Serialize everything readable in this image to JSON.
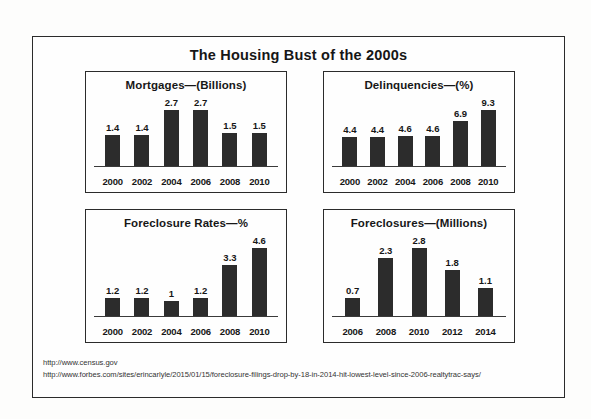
{
  "title": "The Housing Bust of the 2000s",
  "sources": {
    "line1": "http://www.census.gov",
    "line2": "http://www.forbes.com/sites/erincarlyle/2015/01/15/foreclosure-filings-drop-by-18-in-2014-hit-lowest-level-since-2006-realtytrac-says/"
  },
  "colors": {
    "bar": "#2c2c2c",
    "frame": "#2b2b2b",
    "text": "#161616",
    "background": "#fefefe"
  },
  "chart_data": [
    {
      "type": "bar",
      "title": "Mortgages—(Billions)",
      "xlabel": "",
      "ylabel": "Billions",
      "categories": [
        "2000",
        "2002",
        "2004",
        "2006",
        "2008",
        "2010"
      ],
      "values": [
        1.4,
        1.4,
        2.7,
        2.7,
        1.5,
        1.5
      ],
      "labels": [
        "1.4",
        "1.4",
        "2.7",
        "2.7",
        "1.5",
        "1.5"
      ],
      "ylim": [
        0,
        3.1
      ],
      "grid": false,
      "legend": "none"
    },
    {
      "type": "bar",
      "title": "Delinquencies—(%)",
      "xlabel": "",
      "ylabel": "%",
      "categories": [
        "2000",
        "2002",
        "2004",
        "2006",
        "2008",
        "2010"
      ],
      "values": [
        4.4,
        4.4,
        4.6,
        4.6,
        6.9,
        9.3
      ],
      "labels": [
        "4.4",
        "4.4",
        "4.6",
        "4.6",
        "6.9",
        "9.3"
      ],
      "ylim": [
        0,
        10.4
      ],
      "grid": false,
      "legend": "none"
    },
    {
      "type": "bar",
      "title": "Foreclosure Rates—%",
      "xlabel": "",
      "ylabel": "%",
      "categories": [
        "2000",
        "2002",
        "2004",
        "2006",
        "2008",
        "2010"
      ],
      "values": [
        1.2,
        1.2,
        1.0,
        1.2,
        3.3,
        4.6
      ],
      "labels": [
        "1.2",
        "1.2",
        "1",
        "1.2",
        "3.3",
        "4.6"
      ],
      "ylim": [
        0,
        5.2
      ],
      "grid": false,
      "legend": "none"
    },
    {
      "type": "bar",
      "title": "Foreclosures—(Millions)",
      "xlabel": "",
      "ylabel": "Millions",
      "categories": [
        "2006",
        "2008",
        "2010",
        "2012",
        "2014"
      ],
      "values": [
        0.7,
        2.3,
        2.8,
        1.8,
        1.1
      ],
      "labels": [
        "0.7",
        "2.3",
        "2.8",
        "1.8",
        "1.1"
      ],
      "ylim": [
        0,
        3.15
      ],
      "grid": false,
      "legend": "none"
    }
  ]
}
